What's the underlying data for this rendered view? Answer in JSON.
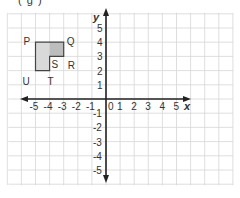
{
  "caption": "( g )",
  "colors": {
    "grid": "#d6d6d6",
    "axis": "#222222",
    "shape_fill": "#d9d9d9",
    "shape_fill_dark": "#bdbdbd",
    "shape_stroke": "#444444",
    "text": "#333333"
  },
  "axes": {
    "x_label": "x",
    "y_label": "y",
    "x_ticks": [
      "-5",
      "-4",
      "-3",
      "-2",
      "-1",
      "0",
      "1",
      "2",
      "3",
      "4",
      "5"
    ],
    "y_ticks_pos": [
      "1",
      "2",
      "3",
      "4",
      "5"
    ],
    "y_ticks_neg": [
      "-1",
      "-2",
      "-3",
      "-4",
      "-5"
    ],
    "x_range": [
      -7,
      9
    ],
    "y_range": [
      -6,
      6
    ]
  },
  "shape": {
    "name": "L-shape PQRSTU",
    "vertices": [
      {
        "label": "P",
        "x": -5,
        "y": 4
      },
      {
        "label": "Q",
        "x": -3,
        "y": 4
      },
      {
        "label": "R",
        "x": -3,
        "y": 3
      },
      {
        "label": "S",
        "x": -4,
        "y": 3
      },
      {
        "label": "T",
        "x": -4,
        "y": 2
      },
      {
        "label": "U",
        "x": -5,
        "y": 2
      }
    ]
  }
}
